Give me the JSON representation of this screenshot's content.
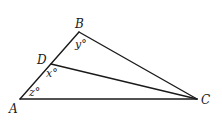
{
  "figure": {
    "stroke_color": "#1a1a1a",
    "background": "#ffffff",
    "points": {
      "A": {
        "x": 20,
        "y": 99
      },
      "B": {
        "x": 79,
        "y": 32
      },
      "C": {
        "x": 197,
        "y": 99
      },
      "D": {
        "x": 51,
        "y": 64
      }
    },
    "segments": [
      "AB",
      "BC",
      "CA",
      "DC"
    ],
    "vertex_labels": {
      "A": "A",
      "B": "B",
      "C": "C",
      "D": "D"
    },
    "angle_labels": {
      "y": "y°",
      "x": "x°",
      "z": "z°"
    },
    "angle_meanings": {
      "y": "angle ABC at vertex B",
      "x": "angle ADC at point D",
      "z": "angle BAC at vertex A"
    }
  }
}
